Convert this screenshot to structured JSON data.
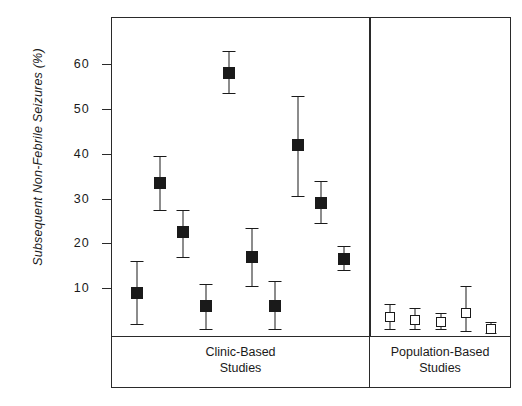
{
  "chart_data": {
    "type": "scatter",
    "title": "",
    "xlabel": "",
    "ylabel": "Subsequent Non-Febrile Seizures (%)",
    "ylim": [
      0,
      65
    ],
    "yticks": [
      10,
      20,
      30,
      40,
      50,
      60
    ],
    "ytick_labels": [
      "10",
      "20",
      "30",
      "40",
      "50",
      "60"
    ],
    "grid": false,
    "legend": false,
    "panels": [
      {
        "name": "clinic-based",
        "label_line1": "Clinic-Based",
        "label_line2": "Studies",
        "marker": "filled-square",
        "points": [
          {
            "value": 9.0,
            "low": 2.0,
            "high": 16.0
          },
          {
            "value": 33.5,
            "low": 27.5,
            "high": 39.5
          },
          {
            "value": 22.5,
            "low": 17.0,
            "high": 27.5
          },
          {
            "value": 6.0,
            "low": 1.0,
            "high": 11.0
          },
          {
            "value": 58.0,
            "low": 53.5,
            "high": 63.0
          },
          {
            "value": 17.0,
            "low": 10.5,
            "high": 23.5
          },
          {
            "value": 6.0,
            "low": 1.0,
            "high": 11.5
          },
          {
            "value": 42.0,
            "low": 30.5,
            "high": 53.0
          },
          {
            "value": 29.0,
            "low": 24.5,
            "high": 34.0
          },
          {
            "value": 16.5,
            "low": 14.0,
            "high": 19.5
          }
        ]
      },
      {
        "name": "population-based",
        "label_line1": "Population-Based",
        "label_line2": "Studies",
        "marker": "open-square",
        "points": [
          {
            "value": 3.5,
            "low": 1.0,
            "high": 6.5
          },
          {
            "value": 3.0,
            "low": 1.0,
            "high": 5.5
          },
          {
            "value": 2.5,
            "low": 1.0,
            "high": 4.5
          },
          {
            "value": 4.5,
            "low": 0.5,
            "high": 10.5
          },
          {
            "value": 1.0,
            "low": 0.0,
            "high": 2.5
          }
        ]
      }
    ],
    "colors": {
      "axis": "#2a2a2a",
      "marker_filled": "#1a1a1a",
      "marker_open_fill": "#ffffff",
      "marker_open_edge": "#1a1a1a",
      "background": "#ffffff"
    }
  }
}
